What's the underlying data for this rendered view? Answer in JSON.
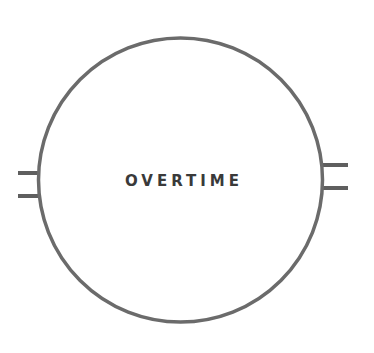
{
  "diagram": {
    "node": {
      "label": "OVERTIME",
      "shape": "circle",
      "stroke_color": "#6b6b6b",
      "fill_color": "#ffffff",
      "text_color": "#3a3a3a"
    },
    "connectors": {
      "left": {
        "count": 2
      },
      "right": {
        "count": 2
      }
    }
  }
}
